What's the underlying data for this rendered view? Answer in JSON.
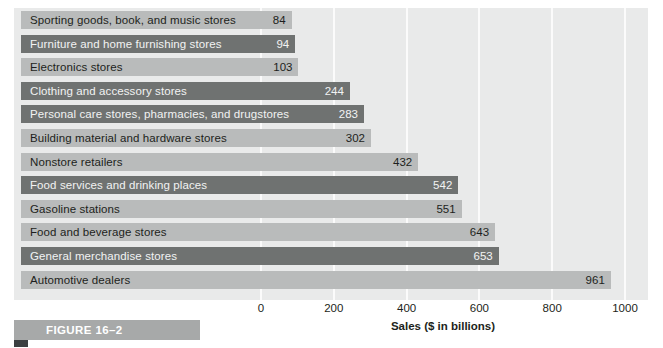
{
  "figure": {
    "caption": "FIGURE 16–2"
  },
  "chart_data": {
    "type": "bar",
    "orientation": "horizontal",
    "title": "",
    "xlabel": "Sales ($ in billions)",
    "ylabel": "",
    "xlim": [
      0,
      1000
    ],
    "xticks": [
      "0",
      "200",
      "400",
      "600",
      "800",
      "1000"
    ],
    "xtick_values": [
      0,
      200,
      400,
      600,
      800,
      1000
    ],
    "grid": true,
    "legend": "none",
    "categories": [
      "Sporting goods, book, and music stores",
      "Furniture and home furnishing stores",
      "Electronics stores",
      "Clothing and accessory stores",
      "Personal care stores, pharmacies, and drugstores",
      "Building material and hardware stores",
      "Nonstore retailers",
      "Food services and drinking places",
      "Gasoline stations",
      "Food and beverage stores",
      "General merchandise stores",
      "Automotive dealers"
    ],
    "values": [
      84,
      94,
      103,
      244,
      283,
      302,
      432,
      542,
      551,
      643,
      653,
      961
    ],
    "value_labels": [
      "84",
      "94",
      "103",
      "244",
      "283",
      "302",
      "432",
      "542",
      "551",
      "643",
      "653",
      "961"
    ],
    "bar_styles": [
      "light",
      "dark",
      "light",
      "dark",
      "dark",
      "light",
      "light",
      "dark",
      "light",
      "light",
      "dark",
      "light"
    ]
  },
  "colors": {
    "bar_light": "#b9bbbb",
    "bar_dark": "#6f7271",
    "panel_background": "#e9eaea",
    "gridline": "#fbfbfb",
    "caption_banner": "#a7a9a9",
    "text_dark": "#1d1f20",
    "text_light": "#f2f3f3"
  }
}
